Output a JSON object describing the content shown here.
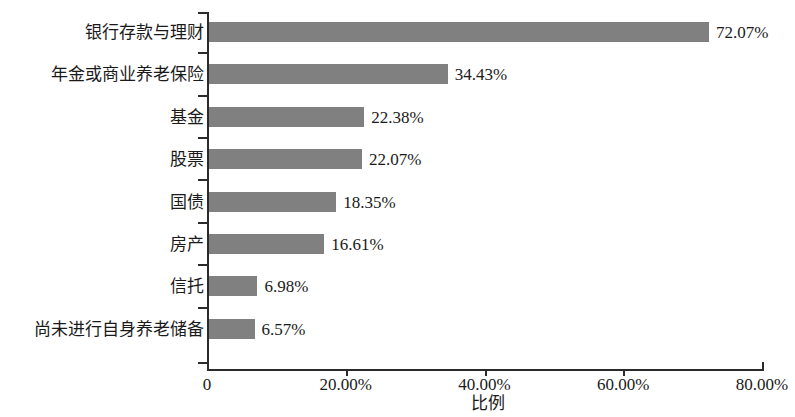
{
  "chart_data": {
    "type": "bar",
    "orientation": "horizontal",
    "title": "",
    "xlabel": "比例",
    "ylabel": "",
    "xlim": [
      0,
      80
    ],
    "grid": false,
    "legend": null,
    "bar_color": "#808080",
    "axis_color": "#2b2b2b",
    "background_color": "#ffffff",
    "categories": [
      "银行存款与理财",
      "年金或商业养老保险",
      "基金",
      "股票",
      "国债",
      "房产",
      "信托",
      "尚未进行自身养老储备"
    ],
    "values": [
      72.07,
      34.43,
      22.38,
      22.07,
      18.35,
      16.61,
      6.98,
      6.57
    ],
    "value_labels": [
      "72.07%",
      "34.43%",
      "22.38%",
      "22.07%",
      "18.35%",
      "16.61%",
      "6.98%",
      "6.57%"
    ],
    "xticks": [
      0,
      20,
      40,
      60,
      80
    ],
    "xtick_labels": [
      "0",
      "20.00%",
      "40.00%",
      "60.00%",
      "80.00%"
    ]
  }
}
